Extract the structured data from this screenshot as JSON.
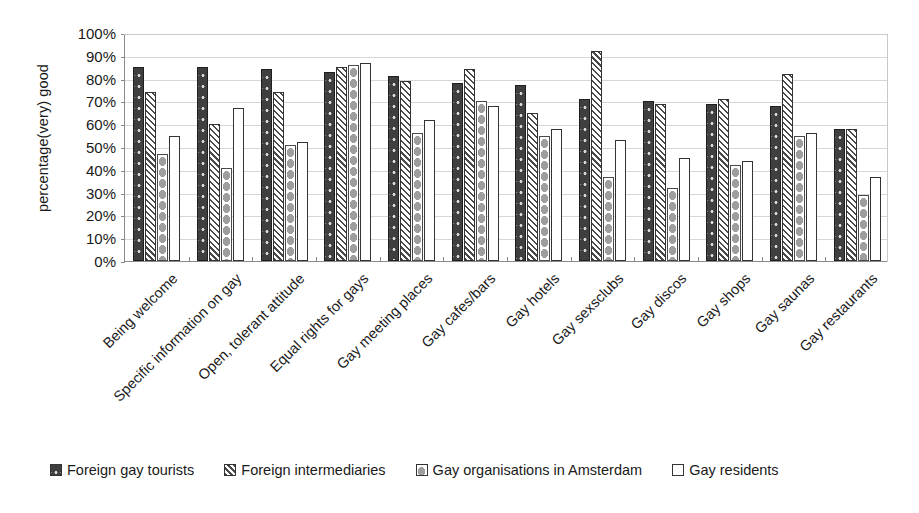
{
  "chart_data": {
    "type": "bar",
    "title": "",
    "subtitle": "",
    "xlabel": "",
    "ylabel": "percentage(very) good",
    "ylim": [
      0,
      100
    ],
    "grid": true,
    "legend_position": "bottom",
    "y_ticks": [
      "0%",
      "10%",
      "20%",
      "30%",
      "40%",
      "50%",
      "60%",
      "70%",
      "80%",
      "90%",
      "100%"
    ],
    "y_tick_values": [
      0,
      10,
      20,
      30,
      40,
      50,
      60,
      70,
      80,
      90,
      100
    ],
    "categories": [
      "Being welcome",
      "Specific information on gay",
      "Open, tolerant attitude",
      "Equal rights for gays",
      "Gay meeting places",
      "Gay cafes/bars",
      "Gay hotels",
      "Gay sexsclubs",
      "Gay discos",
      "Gay shops",
      "Gay saunas",
      "Gay restaurants"
    ],
    "series": [
      {
        "name": "Foreign gay tourists",
        "pattern": "solid-dark-dotted",
        "color": "#3f3f3f",
        "values": [
          85,
          85,
          84,
          83,
          81,
          78,
          77,
          71,
          70,
          69,
          68,
          58
        ]
      },
      {
        "name": "Foreign intermediaries",
        "pattern": "diagonal-hatch",
        "color": "#ffffff",
        "values": [
          74,
          60,
          74,
          85,
          79,
          84,
          65,
          92,
          69,
          71,
          82,
          58
        ]
      },
      {
        "name": "Gay organisations in Amsterdam",
        "pattern": "grey-diamonds",
        "color": "#9e9e9e",
        "values": [
          47,
          41,
          51,
          86,
          56,
          70,
          55,
          37,
          32,
          42,
          55,
          29
        ]
      },
      {
        "name": "Gay residents",
        "pattern": "plain-white",
        "color": "#ffffff",
        "values": [
          55,
          67,
          52,
          87,
          62,
          68,
          58,
          53,
          45,
          44,
          56,
          37
        ]
      }
    ]
  }
}
